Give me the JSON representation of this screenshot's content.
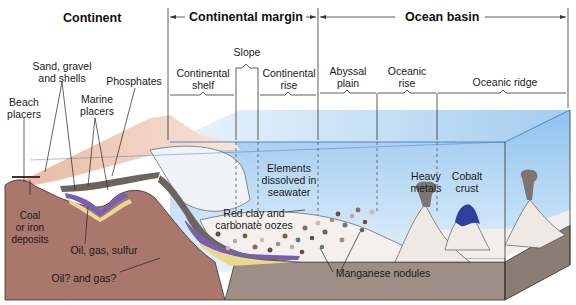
{
  "diagram": {
    "headers": {
      "continent": "Continent",
      "continental_margin": "Continental margin",
      "ocean_basin": "Ocean basin"
    },
    "zones": [
      {
        "id": "shelf",
        "label_line1": "Continental",
        "label_line2": "shelf"
      },
      {
        "id": "slope",
        "label_line1": "Slope",
        "label_line2": ""
      },
      {
        "id": "rise",
        "label_line1": "Continental",
        "label_line2": "rise"
      },
      {
        "id": "abyssal",
        "label_line1": "Abyssal",
        "label_line2": "plain"
      },
      {
        "id": "oceanic-rise",
        "label_line1": "Oceanic",
        "label_line2": "rise"
      },
      {
        "id": "ridge",
        "label_line1": "Oceanic ridge",
        "label_line2": ""
      }
    ],
    "callouts": {
      "sand": {
        "line1": "Sand, gravel",
        "line2": "and shells"
      },
      "beach": {
        "line1": "Beach",
        "line2": "placers"
      },
      "marine": {
        "line1": "Marine",
        "line2": "placers"
      },
      "phosphates": {
        "line1": "Phosphates"
      },
      "coal": {
        "line1": "Coal",
        "line2": "or iron",
        "line3": "deposits"
      },
      "oil_gas_sulfur": {
        "line1": "Oil, gas, sulfur"
      },
      "oil_gas_q": {
        "line1": "Oil? and gas?"
      },
      "elements": {
        "line1": "Elements",
        "line2": "dissolved in",
        "line3": "seawater"
      },
      "red_clay": {
        "line1": "Red clay and",
        "line2": "carbonate oozes"
      },
      "manganese": {
        "line1": "Manganese nodules"
      },
      "heavy_metals": {
        "line1": "Heavy",
        "line2": "metals"
      },
      "cobalt": {
        "line1": "Cobalt",
        "line2": "crust"
      }
    },
    "colors": {
      "land": "#a9776b",
      "water_light": "#cfe4f5",
      "water_dark": "#6aaee6",
      "sediment_purple": "#7a5fb0",
      "sediment_yellow": "#e8d893",
      "sediment_dark": "#6b655e",
      "seafloor": "#9d8f86",
      "cobalt": "#2f3f9e"
    }
  }
}
